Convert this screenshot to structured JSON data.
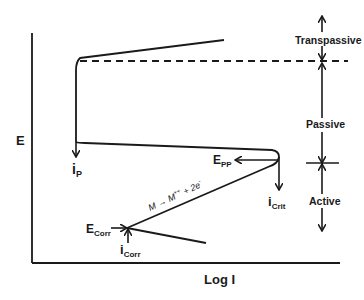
{
  "diagram": {
    "type": "polarization-curve",
    "title": "",
    "axes": {
      "y_label": "E",
      "x_label": "Log I"
    },
    "regions": [
      {
        "id": "transpassive",
        "label": "Transpassive"
      },
      {
        "id": "passive",
        "label": "Passive"
      },
      {
        "id": "active",
        "label": "Active"
      }
    ],
    "annotations": {
      "ip": {
        "main": "i",
        "sub": "P"
      },
      "epp": {
        "main": "E",
        "sub": "PP"
      },
      "icrit": {
        "main": "i",
        "sub": "Crit"
      },
      "ecorr": {
        "main": "E",
        "sub": "Corr"
      },
      "icorr": {
        "main": "i",
        "sub": "Corr"
      },
      "reaction": {
        "text": "M → M",
        "superscript": "++",
        "suffix": " + 2e",
        "suffix_sup": "-"
      }
    },
    "colors": {
      "line": "#1a1a1a",
      "background": "#ffffff"
    }
  }
}
